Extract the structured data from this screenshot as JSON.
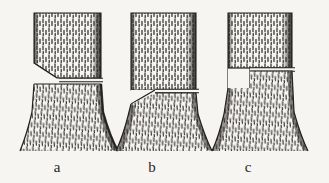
{
  "figure": {
    "name": "tree-felling-cuts-diagram",
    "background_color": "#f7f5f1",
    "ink_color": "#2a2724",
    "caption_labels": [
      {
        "id": "a",
        "text": "a",
        "x": 57,
        "y": 172
      },
      {
        "id": "b",
        "text": "b",
        "x": 152,
        "y": 172
      },
      {
        "id": "c",
        "text": "c",
        "x": 248,
        "y": 172
      }
    ],
    "panels": [
      {
        "id": "a",
        "label": "a",
        "description": "Tree trunk with sloping undercut notch on left and horizontal back cut on right",
        "notch_style": "sloping-undercut",
        "back_cut": "horizontal",
        "back_cut_side": "right"
      },
      {
        "id": "b",
        "label": "b",
        "description": "Tree trunk with high horizontal cut and downward sloping notch from the hinge",
        "notch_style": "inverted-sloping-undercut",
        "back_cut": "horizontal",
        "back_cut_side": "right"
      },
      {
        "id": "c",
        "label": "c",
        "description": "Tree trunk with square step notch on left and horizontal back cut on right",
        "notch_style": "square-step",
        "back_cut": "horizontal",
        "back_cut_side": "right"
      }
    ]
  }
}
